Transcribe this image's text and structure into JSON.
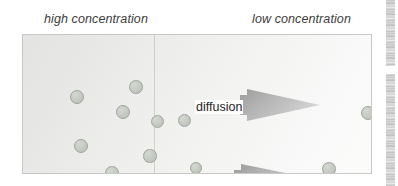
{
  "figure": {
    "width": 398,
    "height": 186,
    "background_color": "#ffffff"
  },
  "captions": {
    "high": "high concentration",
    "low": "low concentration",
    "color": "#3c3c3c",
    "style": "italic"
  },
  "box": {
    "border_color": "#c8c8c8",
    "gradient_from": "#e3e4e2",
    "gradient_to": "#fbfbfa",
    "divider_color": "#aaaca8",
    "x": 22,
    "y": 34,
    "width": 350,
    "height": 140
  },
  "arrows": [
    {
      "label": "diffusion",
      "direction": "right",
      "x": 172,
      "y": 53,
      "length": 80,
      "head_height": 34,
      "fill_color": "#b0b0b0",
      "label_color": "#262626"
    },
    {
      "label": "diffusion",
      "direction": "right",
      "x": 166,
      "y": 128,
      "length": 86,
      "head_height": 34,
      "fill_color": "#b0b0b0",
      "label_color": "#262626"
    }
  ],
  "molecules": {
    "fill_color": "#c7cdc4",
    "border_color": "#9ea49b",
    "count_left": 10,
    "count_right": 4,
    "left_side": [
      {
        "cx": 54,
        "cy": 62,
        "r": 7.0
      },
      {
        "cx": 100,
        "cy": 77,
        "r": 7.0
      },
      {
        "cx": 134,
        "cy": 86,
        "r": 6.5
      },
      {
        "cx": 113,
        "cy": 52,
        "r": 6.8
      },
      {
        "cx": 58,
        "cy": 111,
        "r": 7.0
      },
      {
        "cx": 127,
        "cy": 121,
        "r": 6.6
      },
      {
        "cx": 89,
        "cy": 138,
        "r": 6.8
      },
      {
        "cx": 107,
        "cy": 150,
        "r": 6.5
      },
      {
        "cx": 44,
        "cy": 161,
        "r": 7.0
      },
      {
        "cx": 161,
        "cy": 85,
        "r": 6.5
      }
    ],
    "right_side": [
      {
        "cx": 173,
        "cy": 133,
        "r": 6.3
      },
      {
        "cx": 306,
        "cy": 134,
        "r": 6.8
      },
      {
        "cx": 345,
        "cy": 78,
        "r": 7.0
      }
    ]
  },
  "artifact": {
    "name": "scan-edge-noise",
    "x": 386,
    "width": 9
  }
}
